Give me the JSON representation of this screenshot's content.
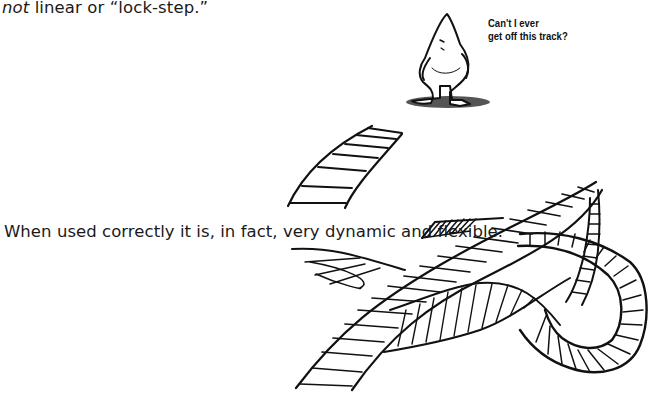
{
  "text": {
    "line1_emph": "not",
    "line1_rest": " linear or “lock-step.”",
    "line2": "When used correctly it is, in fact, very dynamic and flexible."
  },
  "illustration": {
    "caption_line1": "Can't I ever",
    "caption_line2": "get off this track?",
    "subject": "cartoon-figure-standing-on-shadow",
    "scene": "tangled-railroad-tracks"
  }
}
